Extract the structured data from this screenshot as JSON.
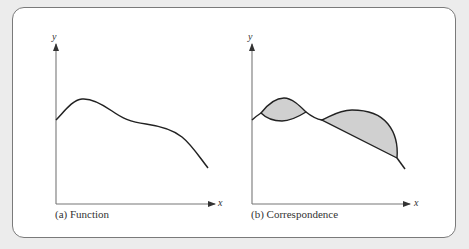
{
  "figure": {
    "panel_a": {
      "caption": "(a) Function",
      "x_label": "x",
      "y_label": "y",
      "description": "Single-valued curve: each x maps to exactly one y"
    },
    "panel_b": {
      "caption": "(b) Correspondence",
      "x_label": "x",
      "y_label": "y",
      "description": "Multi-valued relation with shaded regions where each x maps to a set of y values"
    }
  },
  "colors": {
    "background": "#ececec",
    "panel": "#ffffff",
    "panel_border": "#7a7a7a",
    "curve": "#222222",
    "axis": "#777777",
    "shading": "#d0d0d0"
  }
}
